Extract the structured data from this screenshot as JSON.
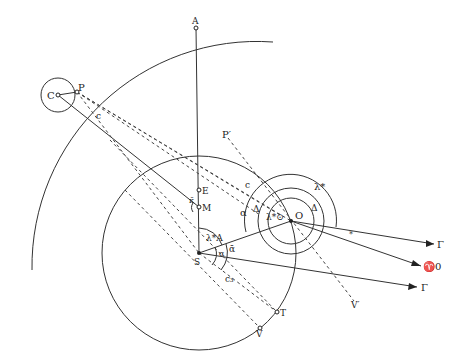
{
  "diagram": {
    "type": "astronomical-geometry",
    "points": [
      {
        "id": "A",
        "label": "A",
        "x": 196,
        "y": 28
      },
      {
        "id": "C",
        "label": "C",
        "x": 58,
        "y": 95
      },
      {
        "id": "P",
        "label": "P",
        "x": 77,
        "y": 92
      },
      {
        "id": "E",
        "label": "E",
        "x": 199,
        "y": 190
      },
      {
        "id": "M",
        "label": "M",
        "x": 199,
        "y": 207
      },
      {
        "id": "S",
        "label": "S̄",
        "x": 199,
        "y": 253
      },
      {
        "id": "O",
        "label": "O",
        "x": 291,
        "y": 221
      },
      {
        "id": "T",
        "label": "T",
        "x": 277,
        "y": 312
      },
      {
        "id": "V",
        "label": "V",
        "x": 260,
        "y": 328
      }
    ],
    "labels": {
      "A": "A",
      "C": "C",
      "P": "P",
      "E": "E",
      "M": "M",
      "S": "S",
      "O": "O",
      "T": "T",
      "V": "V",
      "P_prime": "P′",
      "V_prime": "V′",
      "gamma_top": "Γ",
      "gamma_bottom": "Γ",
      "aries_0": "♈0",
      "c_left": "c",
      "c_right": "c",
      "c3": "c₃",
      "kappa": "κ̄",
      "alpha": "α",
      "alpha_bar": "ᾱ",
      "alpha_small": "α",
      "delta_left": "Δ",
      "delta_right": "Δ",
      "lambda_star": "λ*",
      "lambda_sun": "λ*⊙",
      "lambda_A": "λ*A",
      "epsilon": "*"
    }
  }
}
